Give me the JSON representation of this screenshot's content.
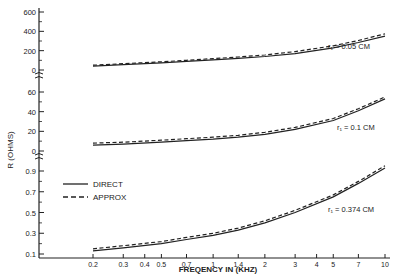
{
  "chart_data": {
    "type": "line",
    "title": "",
    "xlabel": "FREQENCY IN (KHZ)",
    "ylabel": "R (OHMS)",
    "x_scale": "log",
    "x_ticks": [
      0.2,
      0.3,
      0.4,
      0.5,
      0.7,
      1,
      1.4,
      2,
      3,
      4,
      5,
      7,
      10
    ],
    "x_tick_labels": [
      "0.2",
      "0.3",
      "0.4",
      "0.5",
      "0.7",
      "1",
      "1.4",
      "2",
      "3",
      "4",
      "5",
      "7",
      "10"
    ],
    "xlim": [
      0.2,
      10
    ],
    "grid": false,
    "legend": {
      "position": "left-middle",
      "entries": [
        {
          "label": "DIRECT",
          "style": "solid"
        },
        {
          "label": "APPROX",
          "style": "dashed"
        }
      ]
    },
    "panels": [
      {
        "annotation": "r₁ = 0.05 CM",
        "y_tick_labels": [
          "600",
          "400",
          "200",
          "0"
        ],
        "ylim": [
          0,
          600
        ],
        "x": [
          0.2,
          0.3,
          0.5,
          0.7,
          1,
          1.4,
          2,
          3,
          5,
          7,
          10
        ],
        "series": [
          {
            "name": "DIRECT",
            "values": [
              40,
              55,
              75,
              90,
              105,
              120,
              140,
              170,
              230,
              285,
              350
            ]
          },
          {
            "name": "APPROX",
            "values": [
              50,
              65,
              85,
              100,
              118,
              135,
              155,
              190,
              250,
              305,
              375
            ]
          }
        ]
      },
      {
        "annotation": "r₁ = 0.1 CM",
        "y_tick_labels": [
          "60",
          "40",
          "20",
          "0"
        ],
        "ylim": [
          0,
          60
        ],
        "x": [
          0.2,
          0.3,
          0.5,
          0.7,
          1,
          1.4,
          2,
          3,
          5,
          7,
          10
        ],
        "series": [
          {
            "name": "DIRECT",
            "values": [
              6,
              7,
              9,
              10.5,
              12,
              14,
              17,
              22,
              31,
              41,
              53
            ]
          },
          {
            "name": "APPROX",
            "values": [
              8,
              9,
              11,
              12.5,
              14,
              16,
              19,
              24,
              33,
              43,
              55
            ]
          }
        ]
      },
      {
        "annotation": "r₁ = 0.374 CM",
        "y_tick_labels": [
          "0.9",
          "0.7",
          "0.5",
          "0.3",
          "0.1"
        ],
        "ylim": [
          0.1,
          0.9
        ],
        "x": [
          0.2,
          0.3,
          0.5,
          0.7,
          1,
          1.4,
          2,
          3,
          5,
          7,
          10
        ],
        "series": [
          {
            "name": "DIRECT",
            "values": [
              0.13,
              0.16,
              0.2,
              0.24,
              0.28,
              0.33,
              0.4,
              0.5,
              0.65,
              0.78,
              0.93
            ]
          },
          {
            "name": "APPROX",
            "values": [
              0.15,
              0.18,
              0.22,
              0.26,
              0.3,
              0.35,
              0.42,
              0.52,
              0.67,
              0.8,
              0.95
            ]
          }
        ]
      }
    ]
  },
  "labels": {
    "xlabel": "FREQENCY IN (KHZ)",
    "ylabel": "R (OHMS)",
    "legend_direct": "DIRECT",
    "legend_approx": "APPROX",
    "ann1": "r₁ = 0.05 CM",
    "ann2": "r₁ = 0.1 CM",
    "ann3": "r₁ = 0.374 CM"
  }
}
